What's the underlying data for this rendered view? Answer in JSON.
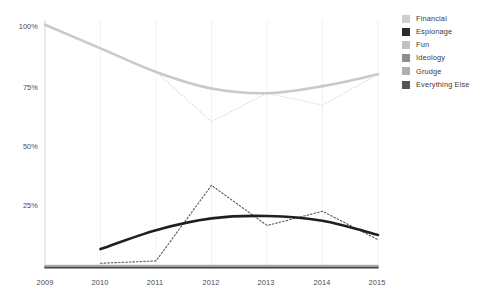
{
  "chart_data": {
    "type": "line",
    "title": "",
    "xlabel": "",
    "ylabel": "",
    "x": [
      2009,
      2010,
      2011,
      2012,
      2013,
      2014,
      2015
    ],
    "categories": [
      "2009",
      "2010",
      "2011",
      "2012",
      "2013",
      "2014",
      "2015"
    ],
    "xlim": [
      2009,
      2015
    ],
    "ylim": [
      0,
      105
    ],
    "ytick_values": [
      25,
      50,
      75,
      100
    ],
    "ytick_labels": [
      "25%",
      "50%",
      "75%",
      "100%"
    ],
    "grid": "vertical-only-faint",
    "legend_position": "top-right",
    "series": [
      {
        "name": "Financial",
        "color": "#c9c9c9",
        "style": "solid",
        "width": 2.6,
        "values": [
          103,
          93,
          83,
          76,
          74,
          77,
          82
        ],
        "raw": {
          "style": "dotted",
          "color": "#e2e2e2",
          "values": [
            103,
            93,
            83,
            62,
            74,
            69,
            82
          ]
        }
      },
      {
        "name": "Espionage",
        "color": "#1f1f1f",
        "style": "solid",
        "width": 2.6,
        "values": [
          null,
          8,
          16,
          21,
          22,
          20,
          14
        ],
        "raw": {
          "style": "dotted",
          "color": "#5a5a5a",
          "values": [
            null,
            2,
            3,
            35,
            18,
            24,
            12
          ]
        }
      },
      {
        "name": "Fun",
        "color": "#b5b5b5",
        "style": "solid",
        "width": 1.6,
        "values": [
          1,
          1,
          1,
          1,
          1,
          1,
          1
        ]
      },
      {
        "name": "Ideology",
        "color": "#8c8c8c",
        "style": "solid",
        "width": 1.6,
        "values": [
          0.6,
          0.6,
          0.6,
          0.6,
          0.6,
          0.6,
          0.6
        ]
      },
      {
        "name": "Grudge",
        "color": "#a8a8a8",
        "style": "solid",
        "width": 1.6,
        "values": [
          0.3,
          0.3,
          0.3,
          0.3,
          0.3,
          0.3,
          0.3
        ]
      },
      {
        "name": "Everything Else",
        "color": "#4d4d4d",
        "style": "solid",
        "width": 1.6,
        "values": [
          0.1,
          0.1,
          0.1,
          0.1,
          0.1,
          0.1,
          0.1
        ]
      }
    ]
  },
  "legend": {
    "items": [
      {
        "label": "Financial",
        "color": "#cfcfcf"
      },
      {
        "label": "Espionage",
        "color": "#2b2b2b"
      },
      {
        "label": "Fun",
        "color": "#c2c2c2"
      },
      {
        "label": "Ideology",
        "color": "#8e8e8e"
      },
      {
        "label": "Grudge",
        "color": "#b0b0b0"
      },
      {
        "label": "Everything Else",
        "color": "#555555"
      }
    ]
  },
  "axes": {
    "y_ticks": [
      "100%",
      "75%",
      "50%",
      "25%"
    ],
    "x_ticks": [
      "2009",
      "2010",
      "2011",
      "2012",
      "2013",
      "2014",
      "2015"
    ],
    "axis_color": "#d6d6d6",
    "gridline_color": "#f2f2f2"
  }
}
